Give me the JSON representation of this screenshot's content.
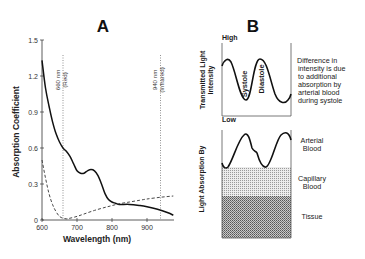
{
  "figure": {
    "panel_a": {
      "label": "A",
      "ylabel": "Absorption Coefficient",
      "xlabel": "Wavelength (nm)",
      "yticks": [
        "0",
        "0.3",
        "0.6",
        "0.9",
        "1.2",
        "1.5"
      ],
      "xticks": [
        "600",
        "700",
        "800",
        "900"
      ],
      "markers": [
        {
          "wavelength": "660 nm",
          "band": "(Red)"
        },
        {
          "wavelength": "940 nm",
          "band": "(Infrared)"
        }
      ]
    },
    "panel_b": {
      "label": "B",
      "top": {
        "ylabel": "Transmitted Light Intensity",
        "ylabel_line1": "Transmitted Light",
        "ylabel_line2": "Intensity",
        "high": "High",
        "low": "Low",
        "systole": "Systole",
        "diastole": "Diastole",
        "note_lines": [
          "Difference in",
          "intensity is due",
          "to additional",
          "absorption by",
          "arterial blood",
          "during systole"
        ]
      },
      "bottom": {
        "ylabel": "Light Absorption By",
        "layers": [
          {
            "line1": "Arterial",
            "line2": "Blood"
          },
          {
            "line1": "Capillary",
            "line2": "Blood"
          },
          {
            "line1": "Tissue",
            "line2": ""
          }
        ]
      }
    }
  },
  "chart_data": [
    {
      "type": "line",
      "title": "A",
      "xlabel": "Wavelength (nm)",
      "ylabel": "Absorption Coefficient",
      "xlim": [
        600,
        975
      ],
      "ylim": [
        0,
        1.5
      ],
      "xticks": [
        600,
        700,
        800,
        900
      ],
      "yticks": [
        0,
        0.3,
        0.6,
        0.9,
        1.2,
        1.5
      ],
      "grid": false,
      "annotations": [
        {
          "x": 660,
          "text": "660 nm (Red)",
          "style": "dotted vertical line"
        },
        {
          "x": 940,
          "text": "940 nm (Infrared)",
          "style": "dotted vertical line"
        }
      ],
      "series": [
        {
          "name": "solid curve",
          "style": "solid",
          "x": [
            600,
            610,
            620,
            630,
            640,
            650,
            660,
            670,
            680,
            690,
            700,
            710,
            720,
            730,
            740,
            750,
            760,
            770,
            780,
            790,
            800,
            810,
            820,
            850,
            880,
            900,
            930,
            960,
            975
          ],
          "values": [
            1.33,
            1.1,
            0.95,
            0.82,
            0.72,
            0.65,
            0.6,
            0.57,
            0.53,
            0.47,
            0.41,
            0.39,
            0.39,
            0.41,
            0.42,
            0.41,
            0.37,
            0.3,
            0.22,
            0.17,
            0.15,
            0.14,
            0.13,
            0.13,
            0.12,
            0.11,
            0.09,
            0.06,
            0.04
          ]
        },
        {
          "name": "dashed curve",
          "style": "dashed",
          "x": [
            600,
            610,
            620,
            630,
            640,
            650,
            660,
            670,
            680,
            700,
            720,
            750,
            780,
            800,
            820,
            850,
            880,
            900,
            940,
            975
          ],
          "values": [
            0.5,
            0.35,
            0.22,
            0.13,
            0.07,
            0.03,
            0.015,
            0.01,
            0.015,
            0.03,
            0.05,
            0.08,
            0.105,
            0.12,
            0.135,
            0.15,
            0.165,
            0.175,
            0.19,
            0.2
          ]
        }
      ]
    },
    {
      "type": "line",
      "title": "B (top)",
      "ylabel": "Transmitted Light Intensity",
      "ylim_labels": [
        "Low",
        "High"
      ],
      "annotations": [
        "Systole",
        "Diastole",
        "Difference in intensity is due to additional absorption by arterial blood during systole"
      ],
      "series": [
        {
          "name": "transmitted intensity",
          "shape": "sinusoid, ~2 cycles"
        }
      ]
    },
    {
      "type": "area",
      "title": "B (bottom)",
      "ylabel": "Light Absorption By",
      "series": [
        {
          "name": "Tissue",
          "style": "dense hatch",
          "level": "constant bottom band"
        },
        {
          "name": "Capillary Blood",
          "style": "light stipple",
          "level": "constant middle band"
        },
        {
          "name": "Arterial Blood",
          "style": "pulsatile line",
          "level": "top, varying"
        }
      ]
    }
  ]
}
